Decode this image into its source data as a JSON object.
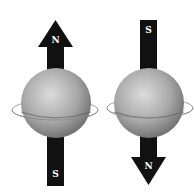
{
  "diagrams": [
    {
      "name": "spin-up",
      "top_label": "N",
      "bottom_label": "S"
    },
    {
      "name": "spin-down",
      "top_label": "S",
      "bottom_label": "N"
    }
  ],
  "colors": {
    "arrow": "#111111",
    "sphere_light": "#d8d8d8",
    "sphere_dark": "#7a7a7a",
    "ring": "#777777",
    "label": "#ffffff"
  }
}
